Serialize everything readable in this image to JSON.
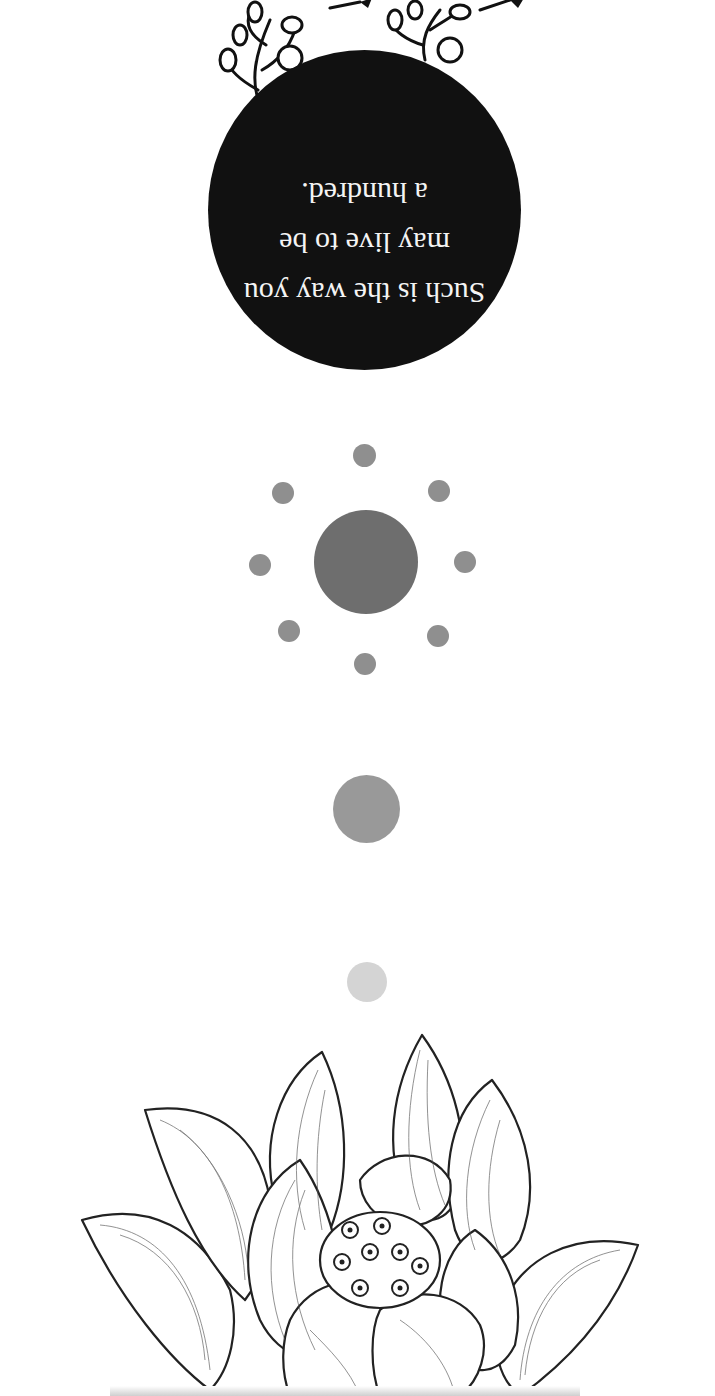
{
  "artwork": {
    "orientation": "rotated 180 degrees",
    "quote": {
      "lines": [
        "Such is the way you",
        "may live to be",
        "a hundred."
      ]
    },
    "colors": {
      "background": "#ffffff",
      "badge": "#111111",
      "quote_text": "#f4f4f4",
      "ring_dots": "#8f8f8f",
      "center_dot": "#6e6e6e",
      "mid_dot": "#999999",
      "small_dot": "#d4d4d4"
    },
    "elements": [
      "floral-branches",
      "quote-badge",
      "dot-ring",
      "mid-dot",
      "small-dot",
      "lotus-drawing"
    ]
  }
}
